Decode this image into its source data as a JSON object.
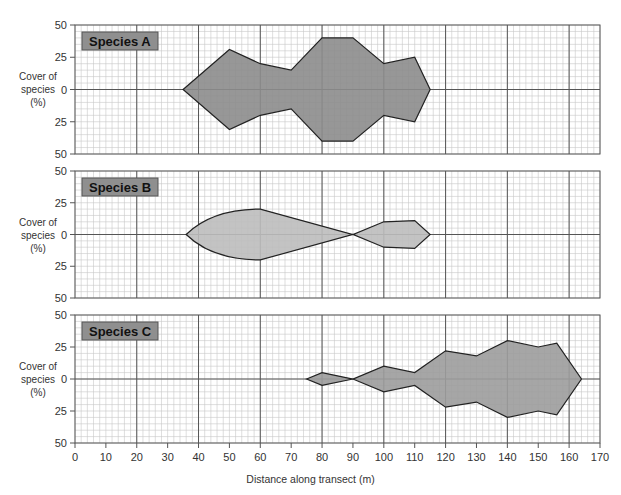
{
  "chart_data": [
    {
      "type": "area",
      "subtype": "kite-diagram",
      "title": "Species A",
      "xlabel": "Distance along transect (m)",
      "ylabel": "Cover of species (%)",
      "ylim": [
        -50,
        50
      ],
      "yticks": [
        "50",
        "25",
        "0",
        "25",
        "50"
      ],
      "xlim": [
        0,
        170
      ],
      "grid": true,
      "fill": "#8c8c8c",
      "points": [
        [
          35,
          0
        ],
        [
          50,
          31
        ],
        [
          60,
          20
        ],
        [
          70,
          15
        ],
        [
          80,
          40
        ],
        [
          90,
          40
        ],
        [
          100,
          20
        ],
        [
          110,
          25
        ],
        [
          115,
          0
        ]
      ]
    },
    {
      "type": "area",
      "subtype": "kite-diagram",
      "title": "Species B",
      "xlabel": "Distance along transect (m)",
      "ylabel": "Cover of species (%)",
      "ylim": [
        -50,
        50
      ],
      "yticks": [
        "50",
        "25",
        "0",
        "25",
        "50"
      ],
      "xlim": [
        0,
        170
      ],
      "grid": true,
      "fill": "#bdbdbd",
      "points": [
        [
          36,
          0
        ],
        [
          40,
          9
        ],
        [
          45,
          14
        ],
        [
          50,
          17
        ],
        [
          60,
          20
        ],
        [
          90,
          0
        ],
        [
          100,
          10
        ],
        [
          110,
          11
        ],
        [
          115,
          0
        ]
      ],
      "curved_segment": [
        36,
        60
      ]
    },
    {
      "type": "area",
      "subtype": "kite-diagram",
      "title": "Species C",
      "xlabel": "Distance along transect (m)",
      "ylabel": "Cover of species (%)",
      "ylim": [
        -50,
        50
      ],
      "yticks": [
        "50",
        "25",
        "0",
        "25",
        "50"
      ],
      "xlim": [
        0,
        170
      ],
      "grid": true,
      "fill": "#9c9c9c",
      "points": [
        [
          75,
          0
        ],
        [
          80,
          5
        ],
        [
          90,
          0
        ],
        [
          100,
          10
        ],
        [
          110,
          5
        ],
        [
          120,
          22
        ],
        [
          130,
          18
        ],
        [
          140,
          30
        ],
        [
          150,
          25
        ],
        [
          156,
          28
        ],
        [
          164,
          0
        ]
      ]
    }
  ],
  "axis": {
    "x_ticks": [
      "0",
      "10",
      "20",
      "30",
      "40",
      "50",
      "60",
      "70",
      "80",
      "90",
      "100",
      "110",
      "120",
      "130",
      "140",
      "150",
      "160",
      "170"
    ],
    "x_title": "Distance along transect (m)",
    "y_title_line1": "Cover of",
    "y_title_line2": "species",
    "y_title_line3": "(%)"
  },
  "colors": {
    "major_grid": "#555555",
    "minor_grid": "#c8c8c8",
    "label_box": "#8f8f8f",
    "outline": "#222222"
  }
}
